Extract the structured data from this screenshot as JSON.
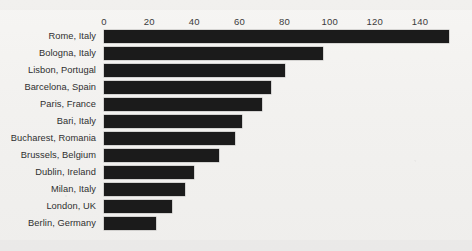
{
  "chart_data": {
    "type": "bar",
    "orientation": "horizontal",
    "title": "",
    "subtitle": "",
    "xlabel": "",
    "ylabel": "",
    "xlim": [
      0,
      150
    ],
    "xticks": [
      0,
      20,
      40,
      60,
      80,
      100,
      120,
      140
    ],
    "xtick_labels": [
      "0",
      "20",
      "40",
      "60",
      "80",
      "100",
      "120",
      "140"
    ],
    "grid": false,
    "legend": false,
    "axis_position": "top",
    "bar_color": "#1b1b1b",
    "background_color": "#f2f1ef",
    "categories": [
      "Rome, Italy",
      "Bologna, Italy",
      "Lisbon, Portugal",
      "Barcelona, Spain",
      "Paris, France",
      "Bari, Italy",
      "Bucharest, Romania",
      "Brussels, Belgium",
      "Dublin, Ireland",
      "Milan, Italy",
      "London, UK",
      "Berlin, Germany"
    ],
    "values": [
      153,
      97,
      80,
      74,
      70,
      61,
      58,
      51,
      40,
      36,
      30,
      23
    ]
  }
}
